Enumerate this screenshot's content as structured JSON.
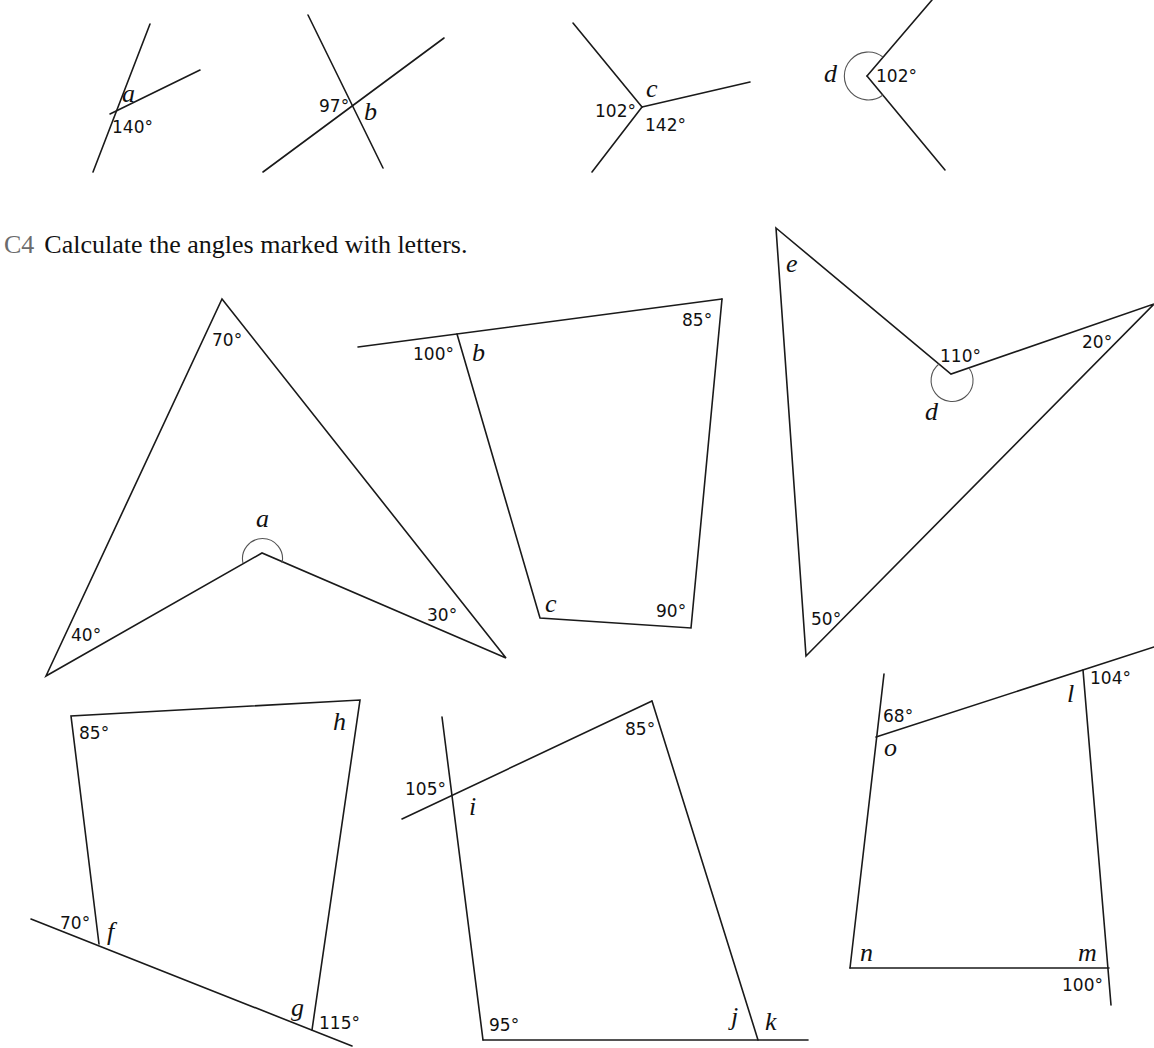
{
  "question": {
    "number": "C4",
    "instruction": "Calculate the angles marked with letters.",
    "accent_color": "#6b6b6b"
  },
  "top_row": [
    {
      "id": "fig-a-lines",
      "unknown": "a",
      "given": [
        "140°"
      ]
    },
    {
      "id": "fig-b-lines",
      "unknown": "b",
      "given": [
        "97°"
      ]
    },
    {
      "id": "fig-c-lines",
      "unknown": "c",
      "given": [
        "102°",
        "142°"
      ]
    },
    {
      "id": "fig-d-lines",
      "unknown": "d",
      "given": [
        "102°"
      ]
    }
  ],
  "shapes": {
    "arrowhead": {
      "unknown": "a",
      "given": [
        "70°",
        "40°",
        "30°"
      ]
    },
    "quad_bc": {
      "unknowns": [
        "b",
        "c"
      ],
      "given": [
        "100°",
        "85°",
        "90°"
      ]
    },
    "arrowhead_de": {
      "unknowns": [
        "e",
        "d"
      ],
      "given": [
        "110°",
        "20°",
        "50°"
      ]
    },
    "quad_fgh": {
      "unknowns": [
        "f",
        "g",
        "h"
      ],
      "given": [
        "85°",
        "70°",
        "115°"
      ]
    },
    "quad_ijk": {
      "unknowns": [
        "i",
        "j",
        "k"
      ],
      "given": [
        "105°",
        "85°",
        "95°"
      ]
    },
    "quad_lmno": {
      "unknowns": [
        "l",
        "m",
        "n",
        "o"
      ],
      "given": [
        "104°",
        "68°",
        "100°"
      ]
    }
  }
}
